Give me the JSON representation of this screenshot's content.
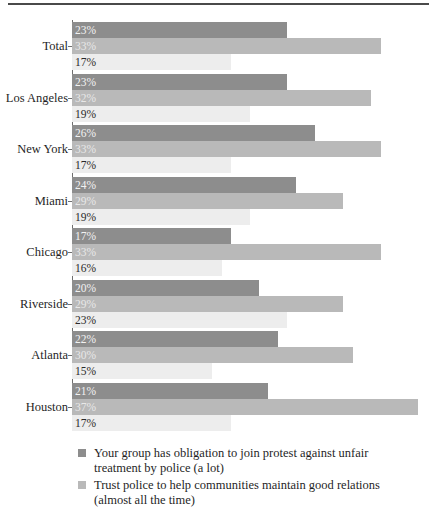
{
  "chart_data": {
    "type": "bar",
    "orientation": "horizontal",
    "title": "",
    "xlabel": "",
    "ylabel": "",
    "grid": false,
    "legend_position": "bottom-left",
    "xlim": [
      0,
      39
    ],
    "value_suffix": "%",
    "categories": [
      "Total",
      "Los Angeles",
      "New York",
      "Miami",
      "Chicago",
      "Riverside",
      "Atlanta",
      "Houston"
    ],
    "series": [
      {
        "name": "Your group has obligation to join protest against unfair treatment by police (a lot)",
        "color": "#8d8d8d",
        "values": [
          23,
          23,
          26,
          24,
          17,
          20,
          22,
          21
        ],
        "labels": [
          "23%",
          "23%",
          "26%",
          "24%",
          "17%",
          "20%",
          "22%",
          "21%"
        ]
      },
      {
        "name": "Trust police to help communities maintain good relations (almost all the time)",
        "color": "#b9b9b9",
        "values": [
          33,
          32,
          33,
          29,
          33,
          29,
          30,
          37
        ],
        "labels": [
          "33%",
          "32%",
          "33%",
          "29%",
          "33%",
          "29%",
          "30%",
          "37%"
        ]
      },
      {
        "name": "",
        "color": "#ededed",
        "values": [
          17,
          19,
          17,
          19,
          16,
          23,
          15,
          17
        ],
        "labels": [
          "17%",
          "19%",
          "17%",
          "19%",
          "16%",
          "23%",
          "15%",
          "17%"
        ]
      }
    ]
  },
  "legend": {
    "entries": [
      {
        "swatch_color": "#8d8d8d",
        "line1": "Your group has obligation to join protest against unfair",
        "line2": "treatment by police (a lot)"
      },
      {
        "swatch_color": "#b9b9b9",
        "line1": "Trust police to help communities maintain good relations",
        "line2": "(almost all the time)"
      }
    ]
  }
}
